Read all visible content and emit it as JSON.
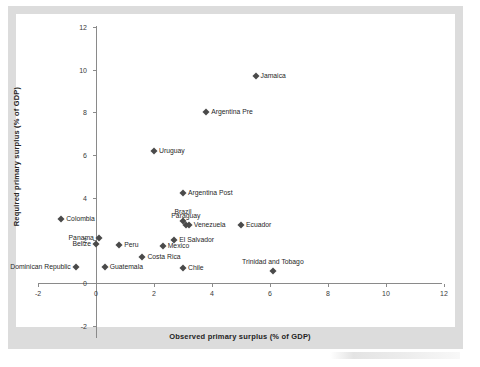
{
  "chart_data": {
    "type": "scatter",
    "title": "",
    "xlabel": "Observed primary surplus (% of GDP)",
    "ylabel": "Required primary surplus (% of GDP)",
    "xlim": [
      -2,
      12
    ],
    "ylim": [
      -2,
      12
    ],
    "xticks": [
      -2,
      0,
      2,
      4,
      6,
      8,
      10,
      12
    ],
    "yticks": [
      -2,
      0,
      2,
      4,
      6,
      8,
      10,
      12
    ],
    "xtick_labels": [
      "-2",
      "0",
      "2",
      "4",
      "6",
      "8",
      "10",
      "12"
    ],
    "ytick_labels": [
      "-2",
      "0",
      "2",
      "4",
      "6",
      "8",
      "10",
      "12"
    ],
    "grid": false,
    "legend": null,
    "marker": "diamond",
    "marker_color": "#4a4a4a",
    "points": [
      {
        "label": "Jamaica",
        "x": 5.5,
        "y": 9.7,
        "label_pos": "right"
      },
      {
        "label": "Argentina Pre",
        "x": 3.8,
        "y": 8.0,
        "label_pos": "right"
      },
      {
        "label": "Uruguay",
        "x": 2.0,
        "y": 6.2,
        "label_pos": "right"
      },
      {
        "label": "Argentina Post",
        "x": 3.0,
        "y": 4.2,
        "label_pos": "right"
      },
      {
        "label": "Colombia",
        "x": -1.2,
        "y": 3.0,
        "label_pos": "right"
      },
      {
        "label": "Brazil",
        "x": 3.0,
        "y": 2.9,
        "label_pos": "above"
      },
      {
        "label": "Paraguay",
        "x": 3.1,
        "y": 2.7,
        "label_pos": "above"
      },
      {
        "label": "Venezuela",
        "x": 3.2,
        "y": 2.7,
        "label_pos": "right"
      },
      {
        "label": "Ecuador",
        "x": 5.0,
        "y": 2.7,
        "label_pos": "right"
      },
      {
        "label": "Panama",
        "x": 0.1,
        "y": 2.1,
        "label_pos": "left"
      },
      {
        "label": "El Salvador",
        "x": 2.7,
        "y": 2.0,
        "label_pos": "right"
      },
      {
        "label": "Belize",
        "x": 0.0,
        "y": 1.85,
        "label_pos": "left"
      },
      {
        "label": "Peru",
        "x": 0.8,
        "y": 1.8,
        "label_pos": "right"
      },
      {
        "label": "Mexico",
        "x": 2.3,
        "y": 1.75,
        "label_pos": "right"
      },
      {
        "label": "Costa Rica",
        "x": 1.6,
        "y": 1.2,
        "label_pos": "right"
      },
      {
        "label": "Dominican Republic",
        "x": -0.7,
        "y": 0.75,
        "label_pos": "left"
      },
      {
        "label": "Guatemala",
        "x": 0.3,
        "y": 0.75,
        "label_pos": "right"
      },
      {
        "label": "Chile",
        "x": 3.0,
        "y": 0.7,
        "label_pos": "right"
      },
      {
        "label": "Trinidad and Tobago",
        "x": 6.1,
        "y": 0.55,
        "label_pos": "above"
      }
    ]
  }
}
